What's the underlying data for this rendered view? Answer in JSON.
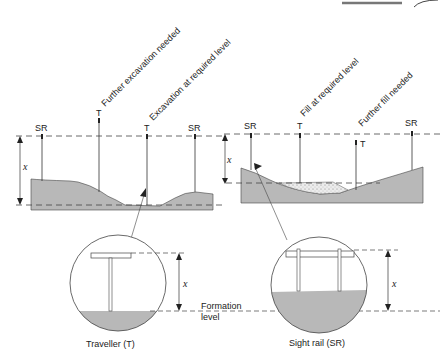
{
  "diagram": {
    "type": "technical-illustration",
    "left_section": {
      "name": "excavation",
      "sight_rail_label_left": "SR",
      "sight_rail_label_right": "SR",
      "traveller_label_1": "T",
      "traveller_label_2": "T",
      "annotation_1": "Further excavation needed",
      "annotation_2": "Excavation at required level",
      "dimension_label": "x"
    },
    "right_section": {
      "name": "fill",
      "sight_rail_label_left": "SR",
      "sight_rail_label_right": "SR",
      "traveller_label_1": "T",
      "traveller_label_2": "T",
      "annotation_1": "Fill at required level",
      "annotation_2": "Further fill needed",
      "dimension_label": "x"
    },
    "detail_traveller": {
      "caption": "Traveller (T)",
      "dimension_label": "x"
    },
    "detail_sight_rail": {
      "caption": "Sight rail (SR)",
      "dimension_label": "x"
    },
    "formation_label_line1": "Formation",
    "formation_label_line2": "level",
    "colors": {
      "ground": "#b8b8b8",
      "line": "#333333",
      "fill_dots": "#e8e8e8"
    }
  }
}
